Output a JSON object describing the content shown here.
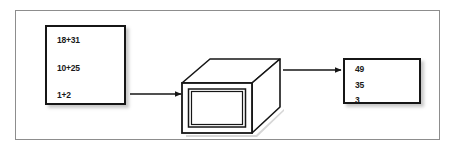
{
  "figure": {
    "name": "summation-process-diagram",
    "type": "flow-diagram",
    "background_color": "#ffffff",
    "frame_border_color": "#8d8d8d",
    "stroke_color": "#161616"
  },
  "input_box": {
    "name": "input-expressions-box",
    "lines": [
      "18+31",
      "10+25",
      "1+2"
    ]
  },
  "processor": {
    "name": "summation-processor",
    "shape": "3d-box",
    "symbol": "Σ",
    "symbol_name": "sigma-symbol"
  },
  "output_box": {
    "name": "output-results-box",
    "lines": [
      "49",
      "35",
      "3"
    ]
  },
  "arrows": [
    {
      "name": "arrow-input-to-processor",
      "glyph": "→"
    },
    {
      "name": "arrow-processor-to-output",
      "glyph": "→"
    }
  ]
}
